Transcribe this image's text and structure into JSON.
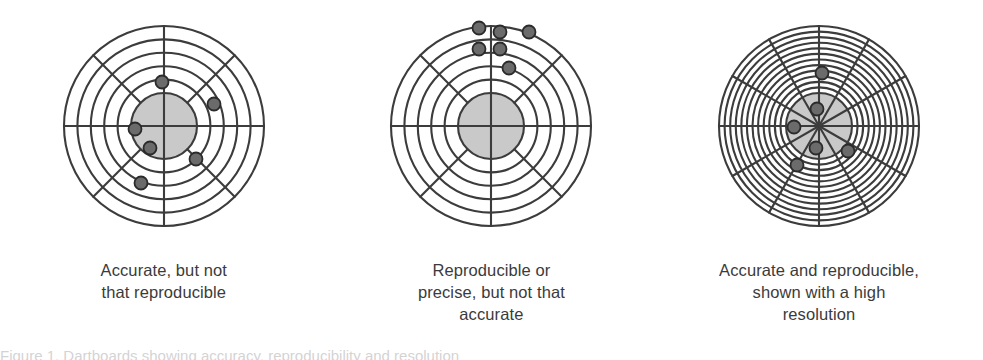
{
  "figure": {
    "background_color": "#ffffff",
    "ink_color": "#3c3c3c",
    "bullseye_fill": "#c9c9c9",
    "dot_fill": "#6b6b6b",
    "dot_stroke": "#2b2b2b",
    "note_text": "Figure 1. Dartboards showing accuracy, reproducibility and resolution"
  },
  "panels": [
    {
      "id": "accurate-not-reproducible",
      "caption_lines": [
        "Accurate, but not",
        "that reproducible"
      ],
      "target": {
        "rings": 5,
        "spokes": 8,
        "spoke_start_angle": 0,
        "outer_radius": 100,
        "bullseye_radius": 33,
        "inner_spokes_hidden": true,
        "dot_radius": 6.5,
        "dots": [
          {
            "x": -2,
            "y": -44
          },
          {
            "x": 50,
            "y": -22
          },
          {
            "x": -29,
            "y": 3
          },
          {
            "x": -14,
            "y": 22
          },
          {
            "x": 32,
            "y": 33
          },
          {
            "x": -23,
            "y": 57
          }
        ]
      }
    },
    {
      "id": "reproducible-not-accurate",
      "caption_lines": [
        "Reproducible or",
        "precise, but not that",
        "accurate"
      ],
      "target": {
        "rings": 5,
        "spokes": 8,
        "spoke_start_angle": 0,
        "outer_radius": 100,
        "bullseye_radius": 33,
        "inner_spokes_hidden": true,
        "dot_radius": 6.5,
        "dots": [
          {
            "x": -12,
            "y": -98
          },
          {
            "x": 9,
            "y": -94
          },
          {
            "x": 38,
            "y": -94
          },
          {
            "x": -12,
            "y": -77
          },
          {
            "x": 9,
            "y": -77
          },
          {
            "x": 18,
            "y": -58
          }
        ]
      }
    },
    {
      "id": "accurate-and-reproducible-high-resolution",
      "caption_lines": [
        "Accurate and reproducible,",
        "shown with a high",
        "resolution"
      ],
      "target": {
        "rings": 12,
        "spokes": 12,
        "spoke_start_angle": 0,
        "outer_radius": 100,
        "bullseye_radius": 33,
        "inner_spokes_hidden": false,
        "dot_radius": 6.5,
        "dots": [
          {
            "x": 3,
            "y": -53
          },
          {
            "x": -2,
            "y": -17
          },
          {
            "x": -25,
            "y": 1
          },
          {
            "x": -3,
            "y": 22
          },
          {
            "x": 29,
            "y": 25
          },
          {
            "x": -22,
            "y": 39
          }
        ]
      }
    }
  ],
  "chart_data": {
    "type": "scatter",
    "xlabel": "",
    "ylabel": "",
    "xlim": [
      -100,
      100
    ],
    "ylim": [
      -100,
      100
    ],
    "grid": "polar",
    "legend_position": "none",
    "series": [
      {
        "name": "Accurate, but not that reproducible",
        "annotation": "Accurate, but not that reproducible",
        "rings": 5,
        "spokes": 8,
        "bullseye_radius": 33,
        "x": [
          -2,
          50,
          -29,
          -14,
          32,
          -23
        ],
        "y": [
          44,
          22,
          -3,
          -22,
          -33,
          -57
        ]
      },
      {
        "name": "Reproducible or precise, but not that accurate",
        "annotation": "Reproducible or precise, but not that accurate",
        "rings": 5,
        "spokes": 8,
        "bullseye_radius": 33,
        "x": [
          -12,
          9,
          38,
          -12,
          9,
          18
        ],
        "y": [
          98,
          94,
          94,
          77,
          77,
          58
        ]
      },
      {
        "name": "Accurate and reproducible, shown with a high resolution",
        "annotation": "Accurate and reproducible, shown with a high resolution",
        "rings": 12,
        "spokes": 12,
        "bullseye_radius": 33,
        "x": [
          3,
          -2,
          -25,
          -3,
          29,
          -22
        ],
        "y": [
          53,
          17,
          -1,
          -22,
          -25,
          -39
        ]
      }
    ]
  }
}
